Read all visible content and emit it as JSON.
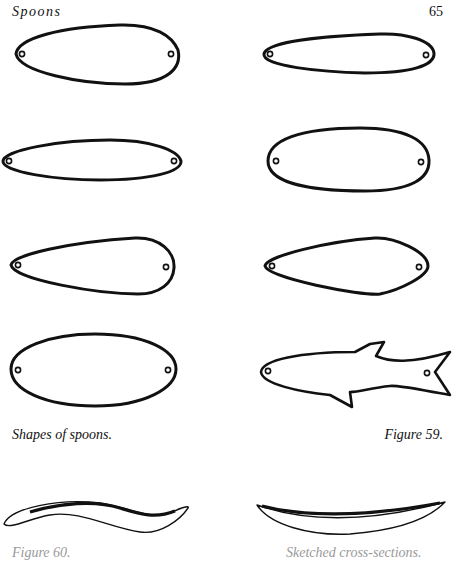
{
  "page": {
    "running_head": "Spoons",
    "page_number": "65"
  },
  "figure": {
    "caption": "Shapes of spoons.",
    "label": "Figure 59.",
    "shapes": [
      {
        "name": "teardrop-wide",
        "position": "row1-left"
      },
      {
        "name": "teardrop-slim",
        "position": "row1-right"
      },
      {
        "name": "willow-leaf",
        "position": "row2-left"
      },
      {
        "name": "rounded-oval",
        "position": "row2-right"
      },
      {
        "name": "pear-drop",
        "position": "row3-left"
      },
      {
        "name": "kite-drop",
        "position": "row3-right"
      },
      {
        "name": "oval",
        "position": "row4-left"
      },
      {
        "name": "fish",
        "position": "row4-right"
      }
    ],
    "profiles": [
      {
        "name": "s-curve-profile",
        "position": "bottom-left"
      },
      {
        "name": "arc-profile",
        "position": "bottom-right"
      }
    ]
  },
  "footer": {
    "cut_caption_left": "Figure 60.",
    "cut_caption_right": "Sketched cross-sections."
  }
}
